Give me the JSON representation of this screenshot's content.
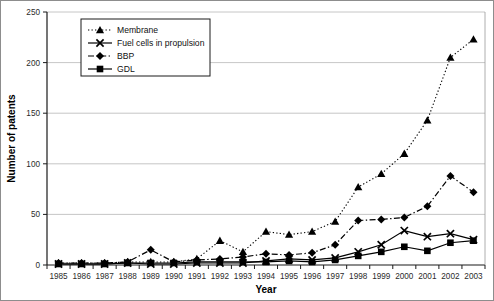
{
  "chart_data": {
    "type": "line",
    "title": "",
    "xlabel": "Year",
    "ylabel": "Number of patents",
    "ylim": [
      0,
      250
    ],
    "yticks": [
      0,
      50,
      100,
      150,
      200,
      250
    ],
    "grid": "horizontal",
    "legend_position": "top-left-inside",
    "categories": [
      "1985",
      "1986",
      "1987",
      "1988",
      "1989",
      "1990",
      "1991",
      "1992",
      "1993",
      "1994",
      "1995",
      "1996",
      "1997",
      "1998",
      "1999",
      "2000",
      "2001",
      "2002",
      "2003"
    ],
    "series": [
      {
        "name": "Membrane",
        "marker": "triangle",
        "line_style": "dotted",
        "values": [
          2,
          2,
          2,
          3,
          3,
          3,
          6,
          24,
          13,
          33,
          30,
          33,
          43,
          77,
          90,
          110,
          143,
          205,
          223
        ]
      },
      {
        "name": "Fuel cells in propulsion",
        "marker": "x",
        "line_style": "solid",
        "values": [
          1,
          1,
          1,
          2,
          1,
          1,
          2,
          2,
          2,
          4,
          6,
          5,
          7,
          13,
          20,
          34,
          28,
          31,
          25
        ]
      },
      {
        "name": "BBP",
        "marker": "diamond",
        "line_style": "dash-dot",
        "values": [
          2,
          2,
          2,
          3,
          15,
          3,
          5,
          6,
          8,
          11,
          10,
          12,
          20,
          44,
          45,
          47,
          58,
          88,
          72
        ]
      },
      {
        "name": "GDL",
        "marker": "square",
        "line_style": "solid",
        "values": [
          1,
          1,
          1,
          2,
          2,
          2,
          3,
          3,
          3,
          3,
          4,
          3,
          5,
          9,
          13,
          18,
          14,
          22,
          24
        ]
      }
    ]
  },
  "legend": {
    "entries": [
      {
        "label": "Membrane"
      },
      {
        "label": "Fuel cells in propulsion"
      },
      {
        "label": "BBP"
      },
      {
        "label": "GDL"
      }
    ]
  },
  "axes": {
    "x_title": "Year",
    "y_title": "Number of patents"
  }
}
